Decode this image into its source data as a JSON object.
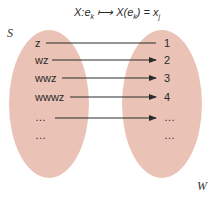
{
  "title": {
    "prefix": "X:e",
    "sub1": "k",
    "arrow": " ⟼ X(e",
    "sub2": "k",
    "mid": ") = x",
    "sub3": "j"
  },
  "sets": {
    "domain_label": "S",
    "codomain_label": "W",
    "fill_color": "#ebc3b6"
  },
  "domain_items": [
    "z",
    "wz",
    "wwz",
    "wwwz",
    "…",
    "…"
  ],
  "codomain_items": [
    "1",
    "2",
    "3",
    "4",
    "…",
    "…"
  ],
  "arrow_color": "#2b2b2b"
}
